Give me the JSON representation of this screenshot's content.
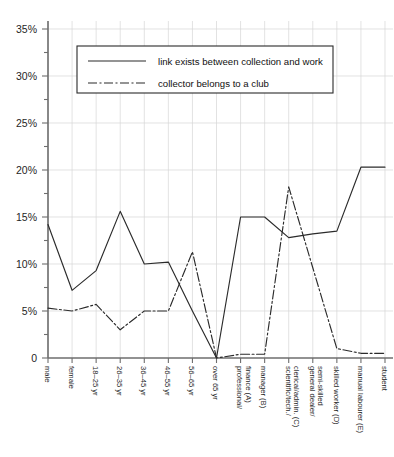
{
  "chart_data": {
    "type": "line",
    "title": "",
    "xlabel": "",
    "ylabel": "",
    "ylim": [
      0,
      35
    ],
    "ytick_labels": [
      "0",
      "5%",
      "10%",
      "15%",
      "20%",
      "25%",
      "30%",
      "35%"
    ],
    "ytick_values": [
      0,
      5,
      10,
      15,
      20,
      25,
      30,
      35
    ],
    "minor_tick_step": 2.5,
    "grid": true,
    "legend_position": "upper-left-inside",
    "categories": [
      "male",
      "female",
      "18–25 yr",
      "26–35 yr",
      "36–45 yr",
      "46–55 yr",
      "56–65 yr",
      "over 65 yr",
      "professional/ finance (A)",
      "manager (B)",
      "scientific/tech./ clerical/admin. (C)",
      "general dealer/ semi-skilled",
      "skilled worker (D)",
      "manual labourer (E)",
      "student"
    ],
    "series": [
      {
        "name": "link exists between collection and work",
        "style": "solid",
        "values": [
          14.2,
          7.2,
          9.3,
          15.6,
          10.0,
          10.2,
          5.0,
          0,
          15.0,
          15.0,
          12.8,
          13.2,
          13.5,
          20.3,
          20.3
        ]
      },
      {
        "name": "collector belongs to a club",
        "style": "dash-dot",
        "values": [
          5.3,
          5.0,
          5.7,
          3.0,
          5.0,
          5.0,
          11.3,
          0,
          0.4,
          0.4,
          18.2,
          9.6,
          1.0,
          0.5,
          0.5
        ]
      }
    ]
  },
  "legend": {
    "items": [
      {
        "label": "link exists between collection and work",
        "style": "solid"
      },
      {
        "label": "collector belongs to a club",
        "style": "dash-dot"
      }
    ]
  },
  "axis": {
    "y_labels": [
      "35%",
      "30%",
      "25%",
      "20%",
      "15%",
      "10%",
      "5%",
      "0"
    ],
    "x_labels": [
      {
        "line1": "male",
        "line2": ""
      },
      {
        "line1": "female",
        "line2": ""
      },
      {
        "line1": "18–25 yr",
        "line2": ""
      },
      {
        "line1": "26–35 yr",
        "line2": ""
      },
      {
        "line1": "36–45 yr",
        "line2": ""
      },
      {
        "line1": "46–55 yr",
        "line2": ""
      },
      {
        "line1": "56–65 yr",
        "line2": ""
      },
      {
        "line1": "over 65 yr",
        "line2": ""
      },
      {
        "line1": "professional/",
        "line2": "finance (A)"
      },
      {
        "line1": "manager (B)",
        "line2": ""
      },
      {
        "line1": "scientific/tech./",
        "line2": "clerical/admin. (C)"
      },
      {
        "line1": "general dealer/",
        "line2": "semi-skilled"
      },
      {
        "line1": "skilled worker (D)",
        "line2": ""
      },
      {
        "line1": "manual labourer (E)",
        "line2": ""
      },
      {
        "line1": "student",
        "line2": ""
      }
    ]
  },
  "colors": {
    "line": "#2b2b2b",
    "grid": "#d6d6d6",
    "axis": "#6e6e6e",
    "text": "#1a1a1a",
    "background": "#ffffff"
  },
  "header": {
    "clipped_caption": ""
  }
}
